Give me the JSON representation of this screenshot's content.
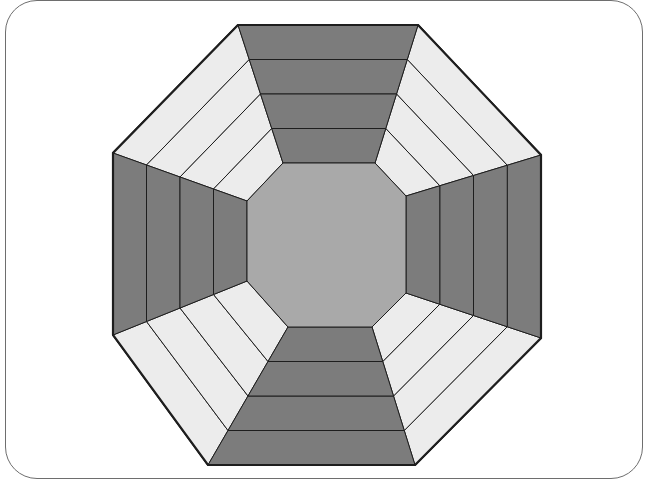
{
  "figure": {
    "colors": {
      "dark": "#7c7c7c",
      "light": "#ececec",
      "center": "#a9a9a9",
      "stroke": "#1e1e1e",
      "frame": "#6e6e6e"
    },
    "outline": [
      [
        238,
        25
      ],
      [
        418,
        25
      ],
      [
        541,
        155
      ],
      [
        541,
        338
      ],
      [
        415,
        465
      ],
      [
        208,
        465
      ],
      [
        113,
        335
      ],
      [
        113,
        153
      ]
    ],
    "rings": {
      "top": [
        25,
        60,
        95,
        130,
        163
      ],
      "bottom": [
        465,
        430,
        396,
        362,
        327
      ],
      "left": [
        113,
        148,
        182,
        215,
        247
      ],
      "right": [
        541,
        507,
        474,
        440,
        406
      ]
    },
    "center_octagon": [
      [
        283,
        163
      ],
      [
        375,
        163
      ],
      [
        406,
        196
      ],
      [
        406,
        293
      ],
      [
        372,
        327
      ],
      [
        288,
        327
      ],
      [
        247,
        281
      ],
      [
        247,
        201
      ]
    ]
  }
}
